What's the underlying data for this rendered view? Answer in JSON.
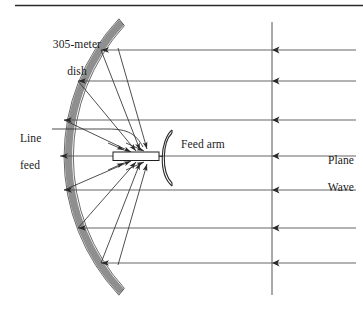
{
  "figure": {
    "type": "schematic-diagram",
    "top_rule": true,
    "background_color": "#ffffff",
    "stroke_color": "#1a1a1a",
    "dish_fill_color": "#8c8c8c",
    "dish_stroke_color": "#2b2b2b"
  },
  "labels": {
    "dish": "305-meter\ndish",
    "dish_line1": "305-meter",
    "dish_line2": "dish",
    "line_feed": "Line\nfeed",
    "line_feed_line1": "Line",
    "line_feed_line2": "feed",
    "feed_arm": "Feed arm",
    "plane_wave": "Plane\nWave",
    "plane_wave_line1": "Plane",
    "plane_wave_line2": "Wave"
  },
  "components": {
    "dish": {
      "name": "305-meter dish",
      "shape": "thick circular arc opening to the right",
      "center_x": 258,
      "center_y": 157,
      "radius": 198,
      "band_thickness": 7,
      "arc_span_degrees": 146,
      "top_tip": [
        121,
        22
      ],
      "bottom_tip": [
        125,
        292
      ],
      "vertex": [
        60,
        157
      ]
    },
    "line_feed": {
      "name": "Line feed",
      "shape": "thin horizontal rectangle",
      "x": 113,
      "y": 152,
      "width": 46,
      "height": 8,
      "fill": "#ffffff"
    },
    "feed_arm": {
      "name": "Feed arm",
      "shape": "C-shaped arc opening right",
      "x": 160,
      "y_top": 130,
      "y_bottom": 186,
      "thickness": 3
    },
    "plane_wave_front": {
      "name": "Plane wave front",
      "shape": "vertical line",
      "x": 272,
      "y_top": 22,
      "y_bottom": 295
    }
  },
  "rays": {
    "description": "Seven horizontal incoming plane-wave rays travelling leftward, each with an arrowhead at the wavefront line and an arrowhead where it meets the dish or feed",
    "count": 7,
    "direction": "right-to-left",
    "x_start": 356,
    "y_positions": [
      50,
      81,
      120,
      156,
      190,
      228,
      263
    ],
    "dish_hit_x": [
      101,
      78,
      63,
      60,
      63,
      78,
      101
    ],
    "wavefront_arrow_x": 272
  },
  "reflected_rays": {
    "description": "Rays reflected from the dish surface converging on the line feed with arrowheads at the feed",
    "count": 8,
    "segments": [
      {
        "from": [
          101,
          50
        ],
        "to": [
          142,
          151
        ]
      },
      {
        "from": [
          78,
          81
        ],
        "to": [
          138,
          152
        ]
      },
      {
        "from": [
          63,
          120
        ],
        "to": [
          133,
          153
        ]
      },
      {
        "from": [
          60,
          156
        ],
        "to": [
          128,
          155
        ]
      },
      {
        "from": [
          63,
          190
        ],
        "to": [
          133,
          160
        ]
      },
      {
        "from": [
          78,
          228
        ],
        "to": [
          138,
          161
        ]
      },
      {
        "from": [
          101,
          263
        ],
        "to": [
          142,
          162
        ]
      },
      {
        "from": [
          118,
          50
        ],
        "to": [
          148,
          150
        ]
      }
    ]
  },
  "leader_lines": {
    "line_feed_leader": {
      "from": [
        50,
        128
      ],
      "to": [
        148,
        148
      ],
      "style": "curved"
    }
  },
  "colors": {
    "ink": "#1a1a1a",
    "dish_gray": "#8c8c8c",
    "ray_gray": "#3a3a3a",
    "paper": "#ffffff"
  }
}
